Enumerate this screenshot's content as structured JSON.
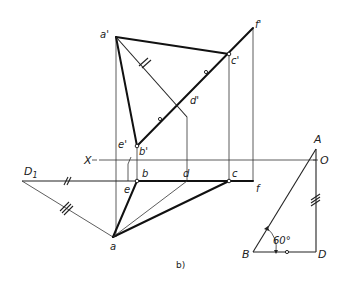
{
  "figure": {
    "caption": "b)",
    "axis": {
      "left_label": "X",
      "right_label": "O"
    },
    "front_view_labels": {
      "a_prime": "a'",
      "b_prime": "b'",
      "c_prime": "c'",
      "d_prime": "d'",
      "e_prime": "e'",
      "f_prime": "f'"
    },
    "top_view_labels": {
      "a": "a",
      "b": "b",
      "c": "c",
      "d": "d",
      "e": "e",
      "f": "f",
      "D1": "D",
      "D1_sub": "1"
    },
    "triangle": {
      "A": "A",
      "B": "B",
      "D": "D",
      "angle_label": "60°"
    }
  }
}
